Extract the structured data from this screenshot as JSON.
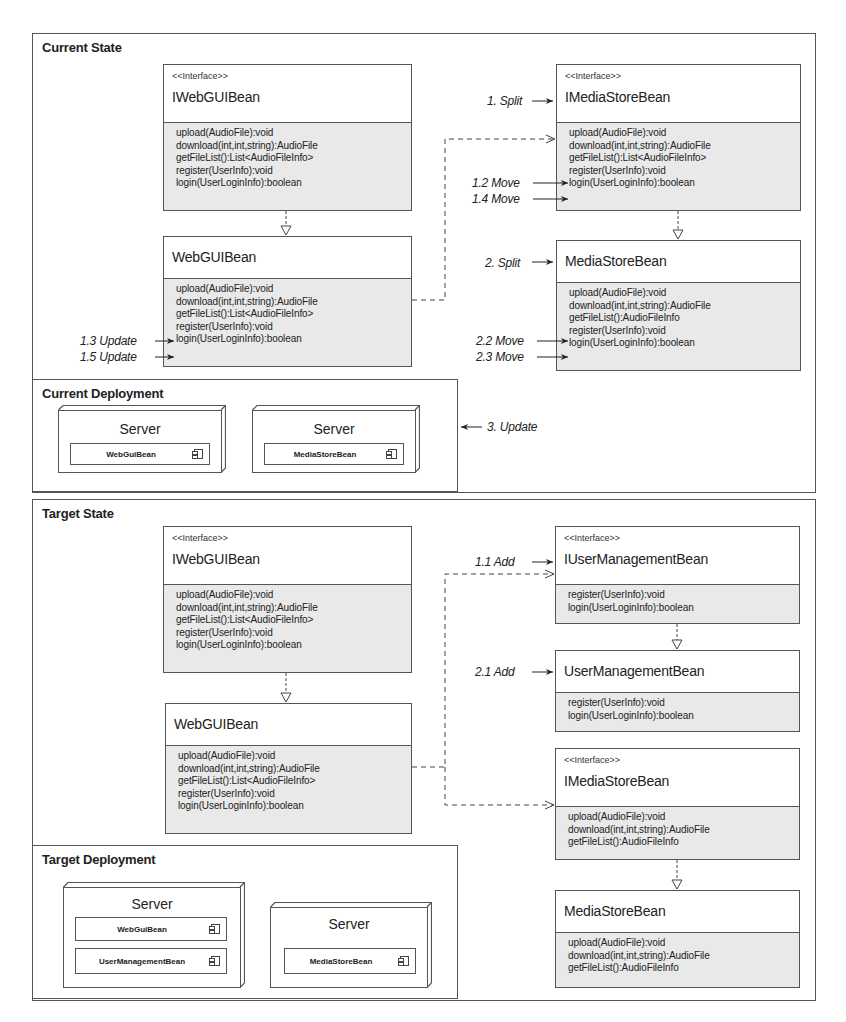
{
  "current_state": {
    "title": "Current State",
    "iwebguibean": {
      "stereotype": "<<Interface>>",
      "name": "IWebGUIBean",
      "methods": [
        "upload(AudioFile):void",
        "download(int,int,string):AudioFile",
        "getFileList():List<AudioFileInfo>",
        "register(UserInfo):void",
        "login(UserLoginInfo):boolean"
      ]
    },
    "webguibean": {
      "name": "WebGUIBean",
      "methods": [
        "upload(AudioFile):void",
        "download(int,int,string):AudioFile",
        "getFileList():List<AudioFileInfo>",
        "register(UserInfo):void",
        "login(UserLoginInfo):boolean"
      ]
    },
    "imediastorebean": {
      "stereotype": "<<Interface>>",
      "name": "IMediaStoreBean",
      "methods": [
        "upload(AudioFile):void",
        "download(int,int,string):AudioFile",
        "getFileList():List<AudioFileInfo>",
        "register(UserInfo):void",
        "login(UserLoginInfo):boolean"
      ]
    },
    "mediastorebean": {
      "name": "MediaStoreBean",
      "methods": [
        "upload(AudioFile):void",
        "download(int,int,string):AudioFile",
        "getFileList():AudioFileInfo",
        "register(UserInfo):void",
        "login(UserLoginInfo):boolean"
      ]
    },
    "annotations": {
      "split1": "1. Split",
      "move12": "1.2 Move",
      "move14": "1.4 Move",
      "update13": "1.3 Update",
      "update15": "1.5 Update",
      "split2": "2. Split",
      "move22": "2.2 Move",
      "move23": "2.3 Move",
      "update3": "3. Update"
    }
  },
  "current_deployment": {
    "title": "Current Deployment",
    "nodes": [
      {
        "title": "Server",
        "components": [
          "WebGuiBean"
        ]
      },
      {
        "title": "Server",
        "components": [
          "MediaStoreBean"
        ]
      }
    ]
  },
  "target_state": {
    "title": "Target State",
    "iwebguibean": {
      "stereotype": "<<Interface>>",
      "name": "IWebGUIBean",
      "methods": [
        "upload(AudioFile):void",
        "download(int,int,string):AudioFile",
        "getFileList():List<AudioFileInfo>",
        "register(UserInfo):void",
        "login(UserLoginInfo):boolean"
      ]
    },
    "webguibean": {
      "name": "WebGUIBean",
      "methods": [
        "upload(AudioFile):void",
        "download(int,int,string):AudioFile",
        "getFileList():List<AudioFileInfo>",
        "register(UserInfo):void",
        "login(UserLoginInfo):boolean"
      ]
    },
    "iusermanagementbean": {
      "stereotype": "<<Interface>>",
      "name": "IUserManagementBean",
      "methods": [
        "register(UserInfo):void",
        "login(UserLoginInfo):boolean"
      ]
    },
    "usermanagementbean": {
      "name": "UserManagementBean",
      "methods": [
        "register(UserInfo):void",
        "login(UserLoginInfo):boolean"
      ]
    },
    "imediastorebean": {
      "stereotype": "<<Interface>>",
      "name": "IMediaStoreBean",
      "methods": [
        "upload(AudioFile):void",
        "download(int,int,string):AudioFile",
        "getFileList():AudioFileInfo"
      ]
    },
    "mediastorebean": {
      "name": "MediaStoreBean",
      "methods": [
        "upload(AudioFile):void",
        "download(int,int,string):AudioFile",
        "getFileList():AudioFileInfo"
      ]
    },
    "annotations": {
      "add11": "1.1 Add",
      "add21": "2.1 Add"
    }
  },
  "target_deployment": {
    "title": "Target Deployment",
    "nodes": [
      {
        "title": "Server",
        "components": [
          "WebGuiBean",
          "UserManagementBean"
        ]
      },
      {
        "title": "Server",
        "components": [
          "MediaStoreBean"
        ]
      }
    ]
  },
  "colors": {
    "line": "#555555",
    "method_bg": "#e9e9e9",
    "background": "#ffffff"
  }
}
